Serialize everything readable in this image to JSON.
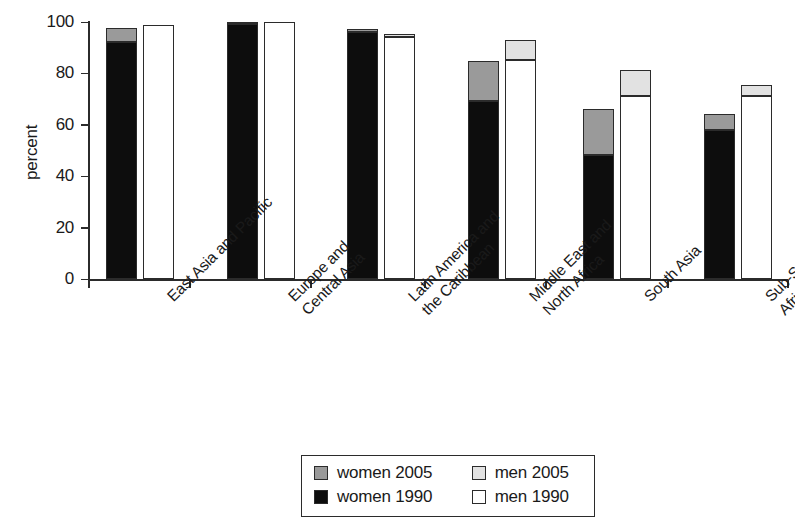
{
  "chart_data": {
    "type": "bar",
    "subtype": "grouped-stacked",
    "title": "",
    "xlabel": "",
    "ylabel": "percent",
    "ylim": [
      0,
      100
    ],
    "yticks": [
      0,
      20,
      40,
      60,
      80,
      100
    ],
    "grid": false,
    "legend_position": "bottom-center",
    "categories": [
      "East Asia and Pacific",
      "Europe and Central Asia",
      "Latin America and the Caribbean",
      "Middle East and North Africa",
      "South Asia",
      "Sub-Saharan Africa"
    ],
    "category_lines": [
      [
        "East Asia and Pacific"
      ],
      [
        "Europe and",
        "Central Asia"
      ],
      [
        "Latin America and",
        "the Caribbean"
      ],
      [
        "Middle East and",
        "North Africa"
      ],
      [
        "South Asia"
      ],
      [
        "Sub-Saharan",
        "Africa"
      ]
    ],
    "series": [
      {
        "name": "women 1990",
        "color": "#0d0d0d",
        "values": [
          92,
          99,
          96,
          69,
          48,
          58
        ]
      },
      {
        "name": "women 2005",
        "color": "#9a9a9a",
        "values": [
          97.5,
          100,
          97,
          84.5,
          66,
          64
        ]
      },
      {
        "name": "men 1990",
        "color": "#ffffff",
        "values": [
          98.5,
          100,
          94,
          85,
          71,
          71
        ]
      },
      {
        "name": "men 2005",
        "color": "#e2e2e2",
        "values": [
          98.5,
          100,
          95,
          93,
          81,
          75.5
        ]
      }
    ]
  },
  "axis": {
    "y_label": "percent",
    "y_tick_labels": [
      "100",
      "80",
      "60",
      "40",
      "20",
      "0"
    ]
  },
  "legend": {
    "items": [
      {
        "label": "women 2005",
        "swatch": "#9a9a9a"
      },
      {
        "label": "men 2005",
        "swatch": "#e2e2e2"
      },
      {
        "label": "women 1990",
        "swatch": "#0d0d0d"
      },
      {
        "label": "men 1990",
        "swatch": "#ffffff"
      }
    ]
  }
}
